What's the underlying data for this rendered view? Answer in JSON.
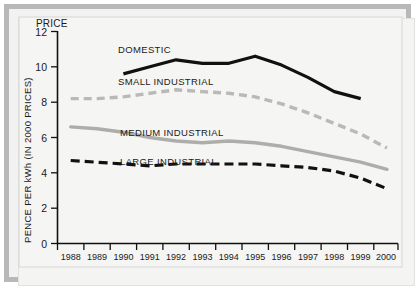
{
  "chart_data": {
    "type": "line",
    "title": "",
    "xlabel": "",
    "ylabel": "PENCE PER kWh (IN 2000 PRICES)",
    "y_axis_header": "PRICE",
    "ylim": [
      0,
      12
    ],
    "yticks": [
      0,
      2,
      4,
      6,
      8,
      10,
      12
    ],
    "grid": false,
    "legend": "inline-labels",
    "categories": [
      "1988",
      "1989",
      "1990",
      "1991",
      "1992",
      "1993",
      "1994",
      "1995",
      "1996",
      "1997",
      "1998",
      "1999",
      "2000"
    ],
    "series": [
      {
        "name": "DOMESTIC",
        "style": "solid-black",
        "color": "#111111",
        "x": [
          "1990",
          "1991",
          "1992",
          "1993",
          "1994",
          "1995",
          "1996",
          "1997",
          "1998",
          "1999"
        ],
        "values": [
          9.6,
          10.0,
          10.4,
          10.2,
          10.2,
          10.6,
          10.1,
          9.4,
          8.6,
          8.2
        ]
      },
      {
        "name": "SMALL INDUSTRIAL",
        "style": "dashed-grey",
        "color": "#b9b9b7",
        "x": [
          "1988",
          "1989",
          "1990",
          "1991",
          "1992",
          "1993",
          "1994",
          "1995",
          "1996",
          "1997",
          "1998",
          "1999",
          "2000"
        ],
        "values": [
          8.2,
          8.2,
          8.3,
          8.5,
          8.7,
          8.6,
          8.5,
          8.3,
          7.9,
          7.4,
          6.8,
          6.2,
          5.4
        ]
      },
      {
        "name": "MEDIUM INDUSTRIAL",
        "style": "solid-grey",
        "color": "#adadab",
        "x": [
          "1988",
          "1989",
          "1990",
          "1991",
          "1992",
          "1993",
          "1994",
          "1995",
          "1996",
          "1997",
          "1998",
          "1999",
          "2000"
        ],
        "values": [
          6.6,
          6.5,
          6.3,
          6.0,
          5.8,
          5.7,
          5.8,
          5.7,
          5.5,
          5.2,
          4.9,
          4.6,
          4.2
        ]
      },
      {
        "name": "LARGE INDUSTRIAL",
        "style": "dashed-black",
        "color": "#111111",
        "x": [
          "1988",
          "1989",
          "1990",
          "1991",
          "1992",
          "1993",
          "1994",
          "1995",
          "1996",
          "1997",
          "1998",
          "1999",
          "2000"
        ],
        "values": [
          4.7,
          4.6,
          4.5,
          4.4,
          4.5,
          4.5,
          4.5,
          4.5,
          4.4,
          4.3,
          4.1,
          3.7,
          3.1
        ]
      }
    ],
    "series_label_positions": [
      {
        "name": "DOMESTIC",
        "x": 118,
        "y": 53
      },
      {
        "name": "SMALL INDUSTRIAL",
        "x": 118,
        "y": 85
      },
      {
        "name": "MEDIUM INDUSTRIAL",
        "x": 120,
        "y": 136
      },
      {
        "name": "LARGE INDUSTRIAL",
        "x": 120,
        "y": 165
      }
    ]
  }
}
